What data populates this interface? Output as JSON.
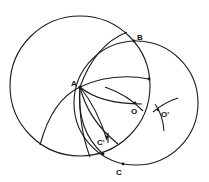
{
  "diagram": {
    "title": "",
    "labels": {
      "A": "A",
      "B": "B",
      "C": "C",
      "C_prime": "C'",
      "O": "O",
      "O_prime": "O'"
    },
    "circles": [
      {
        "name": "circle-left",
        "cx": 80,
        "cy": 86,
        "r": 70
      },
      {
        "name": "circle-right",
        "cx": 136,
        "cy": 103,
        "r": 62
      }
    ],
    "points": {
      "A": [
        80,
        87
      ],
      "B": [
        134,
        41
      ],
      "O": [
        135,
        103
      ],
      "O_prime": [
        158,
        110
      ],
      "C_prime": [
        107,
        137
      ],
      "C": [
        123,
        164
      ],
      "upper_right_mark": [
        149,
        79
      ],
      "lower_intersection": [
        103,
        154
      ]
    },
    "colors": {
      "stroke": "#1a1a1a",
      "background": "#ffffff"
    }
  }
}
